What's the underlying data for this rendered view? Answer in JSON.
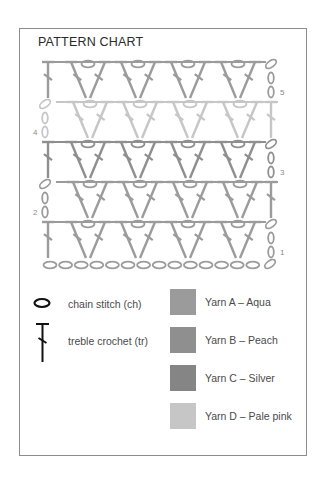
{
  "title": "PATTERN CHART",
  "colors": {
    "frame": "#8c8c8c",
    "yarn_a": "#9b9b9b",
    "yarn_b": "#8f8f8f",
    "yarn_c": "#858585",
    "yarn_d": "#c6c6c6"
  },
  "chart": {
    "rows": [
      {
        "number": "5",
        "y_top": 60,
        "color_key": "yarn_a",
        "turning_side": "right"
      },
      {
        "number": "4",
        "y_top": 100,
        "color_key": "yarn_d",
        "turning_side": "left"
      },
      {
        "number": "3",
        "y_top": 140,
        "color_key": "yarn_b",
        "turning_side": "right"
      },
      {
        "number": "2",
        "y_top": 180,
        "color_key": "yarn_a",
        "turning_side": "left"
      },
      {
        "number": "1",
        "y_top": 220,
        "color_key": "yarn_a",
        "turning_side": "right"
      }
    ],
    "foundation_chain": {
      "count": 14,
      "y": 265,
      "color_key": "yarn_a"
    },
    "v_clusters_per_row": 4
  },
  "legend": {
    "symbols": [
      {
        "icon": "chain-stitch-icon",
        "label": "chain stitch (ch)"
      },
      {
        "icon": "treble-crochet-icon",
        "label": "treble crochet (tr)"
      }
    ],
    "yarns": [
      {
        "label": "Yarn A – Aqua",
        "color": "#9b9b9b"
      },
      {
        "label": "Yarn B – Peach",
        "color": "#8f8f8f"
      },
      {
        "label": "Yarn C – Silver",
        "color": "#858585"
      },
      {
        "label": "Yarn D – Pale pink",
        "color": "#c6c6c6"
      }
    ]
  }
}
